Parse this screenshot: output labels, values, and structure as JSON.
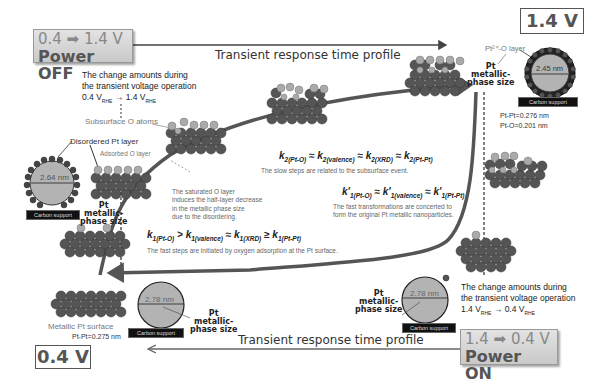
{
  "power_off_box": {
    "line1": "0.4 ➡ 1.4 V",
    "line2": "Power OFF"
  },
  "power_on_box": {
    "line1": "1.4 ➡ 0.4 V",
    "line2": "Power ON"
  },
  "voltage_labels": {
    "high": "1.4 V",
    "low": "0.4 V"
  },
  "profile_top": "Transient response time profile",
  "profile_bottom": "Transient response time profile",
  "change_top": {
    "line1": "The change amounts during",
    "line2": "the transient voltage operation",
    "line3": "0.4 V",
    "sub_rhe_a": "RHE",
    "arrow": " → 1.4 V",
    "sub_rhe_b": "RHE"
  },
  "change_bottom": {
    "line1": "The change amounts during",
    "line2": "the transient voltage operation",
    "line3": "1.4 V",
    "sub_rhe_a": "RHE",
    "arrow": " → 0.4 V",
    "sub_rhe_b": "RHE"
  },
  "labels": {
    "subsurface_o": "Subsurface O atoms",
    "disordered_pt": "Disordered Pt layer",
    "adsorbed_o": "Adsorbed O layer",
    "pt2o_layer": "Pt²⁺-O layer",
    "metallic_surface": "Metallic Pt surface",
    "pt_metallic_phase_size": [
      "Pt",
      "metallic-",
      "phase size"
    ],
    "carbon_support": "Carbon support"
  },
  "particles": {
    "left": {
      "diameter": "2.64 nm"
    },
    "top_right": {
      "diameter": "2.45 nm",
      "bond_ptpt": "Pt-Pt=0.276 nm",
      "bond_pto": "Pt-O=0.201 nm"
    },
    "bottom_left": {
      "diameter": "2.78 nm",
      "bond_ptpt": "Pt-Pt=0.275 nm"
    },
    "bottom_right": {
      "diameter": "2.78 nm"
    }
  },
  "saturated_note": {
    "line1": "The saturated O layer",
    "line2": "induces the half-layer decrease",
    "line3": "in the metallic phase size",
    "line4": "due to the disordering."
  },
  "equations": {
    "k2": {
      "t1": "k",
      "s1": "2(Pt-O)",
      "op1": " ≈ ",
      "t2": "k",
      "s2": "2(valence)",
      "op2": " ≈ ",
      "t3": "k",
      "s3": "2(XRD)",
      "op3": " ≈ ",
      "t4": "k",
      "s4": "2(Pt-Pt)"
    },
    "k2_note": "The slow steps are related to the subsurface event.",
    "k1p": {
      "t1": "k'",
      "s1": "1(Pt-O)",
      "op1": " ≈ ",
      "t2": "k'",
      "s2": "1(valence)",
      "op2": " ≈ ",
      "t3": "k'",
      "s3": "1(Pt-Pt)"
    },
    "k1p_note_1": "The fast transformations are concerted to",
    "k1p_note_2": "form the original Pt metallic nanoparticles.",
    "k1": {
      "t1": "k",
      "s1": "1(Pt-O)",
      "op1": " > ",
      "t2": "k",
      "s2": "1(valence)",
      "op2": " ≈ ",
      "t3": "k",
      "s3": "1(XRD)",
      "op3": " ≥ ",
      "t4": "k",
      "s4": "1(Pt-Pt)"
    },
    "k1_note": "The fast steps are  initiated by oxygen adsorption at the Pt surface."
  },
  "colors": {
    "pt_atom": "#555555",
    "o_atom": "#a8a8a8",
    "curve": "#444444",
    "particle_core": "#b3b3b3"
  }
}
